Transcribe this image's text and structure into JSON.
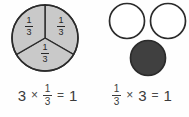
{
  "figure": {
    "background_color": "#fefefe",
    "text_color": "#3b3b3b"
  },
  "panels": [
    {
      "id": "left",
      "model": {
        "type": "pie-thirds",
        "shape": "circle",
        "parts_total": 3,
        "parts_shaded": 3,
        "fill_color": "#c9c9c9",
        "stroke_color": "#2b2b2b",
        "labels": [
          {
            "numerator": "1",
            "denominator": "3"
          },
          {
            "numerator": "1",
            "denominator": "3"
          },
          {
            "numerator": "1",
            "denominator": "3"
          }
        ]
      },
      "equation": {
        "terms": [
          {
            "kind": "number",
            "text": "3"
          },
          {
            "kind": "operator",
            "text": "×"
          },
          {
            "kind": "fraction",
            "numerator": "1",
            "denominator": "3"
          },
          {
            "kind": "operator",
            "text": "="
          },
          {
            "kind": "number",
            "text": "1"
          }
        ],
        "plain": "3 × 1/3 = 1"
      }
    },
    {
      "id": "right",
      "model": {
        "type": "three-circles",
        "shape": "circle",
        "count": 3,
        "empty_count": 2,
        "filled_count": 1,
        "empty_fill_color": "#ffffff",
        "filled_fill_color": "#404040",
        "stroke_color": "#2b2b2b"
      },
      "equation": {
        "terms": [
          {
            "kind": "fraction",
            "numerator": "1",
            "denominator": "3"
          },
          {
            "kind": "operator",
            "text": "×"
          },
          {
            "kind": "number",
            "text": "3"
          },
          {
            "kind": "operator",
            "text": "="
          },
          {
            "kind": "number",
            "text": "1"
          }
        ],
        "plain": "1/3 × 3 = 1"
      }
    }
  ]
}
